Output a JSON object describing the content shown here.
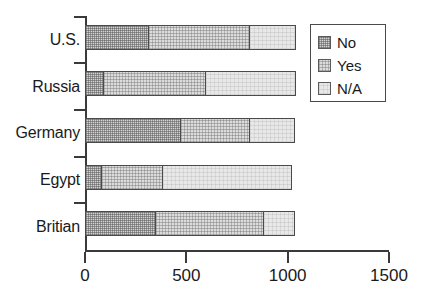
{
  "chart_data": {
    "type": "bar",
    "orientation": "horizontal",
    "stacked": true,
    "title": "",
    "xlabel": "",
    "ylabel": "",
    "categories": [
      "U.S.",
      "Russia",
      "Germany",
      "Egypt",
      "Britian"
    ],
    "series": [
      {
        "name": "No",
        "values": [
          305,
          85,
          465,
          75,
          340
        ]
      },
      {
        "name": "Yes",
        "values": [
          500,
          500,
          340,
          300,
          535
        ]
      },
      {
        "name": "N/A",
        "values": [
          225,
          445,
          220,
          635,
          150
        ]
      }
    ],
    "totals": [
      1030,
      1030,
      1025,
      1010,
      1025
    ],
    "xlim": [
      0,
      1500
    ],
    "xticks": [
      0,
      500,
      1000,
      1500
    ],
    "xtick_labels": [
      "0",
      "500",
      "1000",
      "1500"
    ],
    "grid": false,
    "legend_position": "top-right",
    "legend_entries": [
      "No",
      "Yes",
      "N/A"
    ],
    "colors": {
      "no": "#d2d2d2",
      "yes": "#dcdcdc",
      "na": "#e8e8e8",
      "outline": "#4a4a4a",
      "axis": "#3a3a3a",
      "text": "#1a1a1a",
      "background": "#ffffff"
    }
  }
}
